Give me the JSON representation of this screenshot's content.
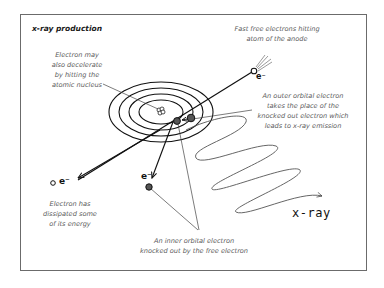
{
  "title": "x-ray production",
  "labels": {
    "nucleus_decel": [
      "Electron may",
      "also decelerate",
      "by hitting the",
      "atomic nucleus"
    ],
    "fast_free": [
      "Fast free electrons hitting",
      "atom of the anode"
    ],
    "outer_orbital": [
      "An outer orbital electron",
      "takes the place of the",
      "knocked out electron which",
      "leads to x-ray emission"
    ],
    "dissipated": [
      "Electron has",
      "dissipated some",
      "of its energy"
    ],
    "inner_orbital": [
      "An inner orbital electron",
      "knocked out by the free electron"
    ],
    "xray": "x-ray",
    "electron_symbol": "e⁻"
  },
  "colors": {
    "frame": "#6b6b6b",
    "ink": "#111111",
    "label": "#5a5a5a",
    "electron_fill": "#555555"
  }
}
